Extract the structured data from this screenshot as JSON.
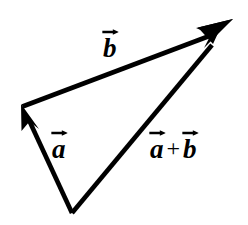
{
  "figure": {
    "type": "vector-addition-triangle-diagram",
    "width": 248,
    "height": 225,
    "background_color": "#ffffff",
    "stroke_color": "#000000",
    "stroke_width": 4.6
  },
  "points": {
    "origin": {
      "label": "tail of a and a+b",
      "x": 72,
      "y": 213
    },
    "left_vertex": {
      "label": "head of a / tail of b",
      "x": 22,
      "y": 105
    },
    "apex": {
      "label": "head of b and a+b",
      "x": 226,
      "y": 28
    }
  },
  "vectors": [
    {
      "name": "a",
      "label_text": "a",
      "accent": "rightwards-arrow-above",
      "from": "origin",
      "to": "left_vertex",
      "x1": 72,
      "y1": 213,
      "x2": 22,
      "y2": 105,
      "arrowhead": "filled-triangle",
      "arrowhead_at": "head"
    },
    {
      "name": "b",
      "label_text": "b",
      "accent": "rightwards-arrow-above",
      "from": "left_vertex",
      "to": "apex",
      "x1": 22,
      "y1": 105,
      "x2": 226,
      "y2": 28,
      "arrowhead": "filled-triangle",
      "arrowhead_at": "head"
    },
    {
      "name": "a_plus_b",
      "label_text": "a + b",
      "accent": "rightwards-arrow-above-each-term",
      "from": "origin",
      "to": "apex",
      "x1": 72,
      "y1": 213,
      "x2": 226,
      "y2": 28,
      "arrowhead": "filled-triangle",
      "arrowhead_at": "head"
    }
  ],
  "labels": {
    "b": {
      "glyph": "b",
      "x": 112,
      "y": 45
    },
    "a": {
      "glyph": "a",
      "x": 63,
      "y": 146
    },
    "sum": {
      "left_glyph": "a",
      "operator": "+",
      "right_glyph": "b",
      "x": 183,
      "y": 147
    }
  }
}
